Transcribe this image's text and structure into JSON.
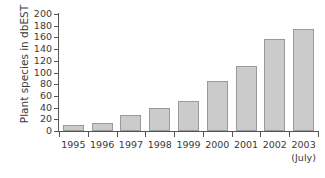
{
  "chart_data": {
    "type": "bar",
    "title": "",
    "subtitle": "",
    "xlabel": "",
    "ylabel": "Plant species in dbEST",
    "categories": [
      "1995",
      "1996",
      "1997",
      "1998",
      "1999",
      "2000",
      "2001",
      "2002",
      "2003"
    ],
    "values": [
      10,
      14,
      27,
      40,
      51,
      85,
      111,
      158,
      175
    ],
    "ylim": [
      0,
      200
    ],
    "ytick_labels": [
      "0",
      "20",
      "40",
      "60",
      "80",
      "100",
      "120",
      "140",
      "160",
      "180",
      "200"
    ],
    "ytick_values": [
      0,
      20,
      40,
      60,
      80,
      100,
      120,
      140,
      160,
      180,
      200
    ],
    "grid": false,
    "legend": null,
    "annotations": [
      {
        "text": "(July)",
        "attached_to": "2003",
        "position": "below-x-tick-label"
      }
    ],
    "bar_color": "#cbcbcb",
    "bar_border_color": "#9a9a9a",
    "axis_color": "#555555",
    "text_color": "#3a3a3a",
    "background_color": "#ffffff"
  },
  "axis": {
    "x_sublabel": "(July)"
  }
}
